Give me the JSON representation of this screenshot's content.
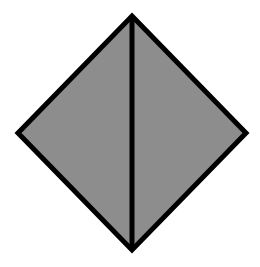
{
  "diagram": {
    "shape": "rhombus-divided",
    "colors": {
      "fill": "#8d8d8d",
      "stroke": "#000000",
      "background": "#ffffff"
    },
    "vertices": {
      "top": [
        132,
        16
      ],
      "right": [
        246,
        133
      ],
      "bottom": [
        132,
        250
      ],
      "left": [
        18,
        133
      ]
    },
    "divider": {
      "from": "top",
      "to": "bottom"
    },
    "regions": [
      {
        "name": "left-triangle"
      },
      {
        "name": "right-triangle"
      }
    ]
  }
}
